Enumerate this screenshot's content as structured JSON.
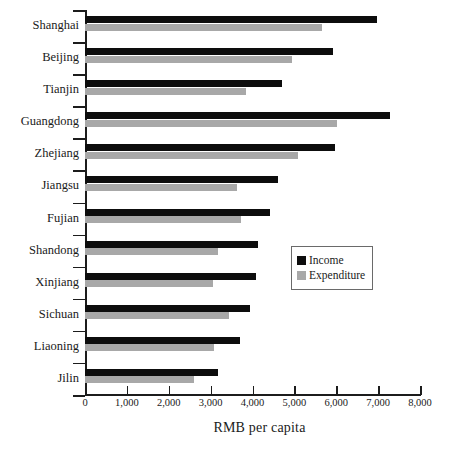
{
  "chart_data": {
    "type": "bar",
    "orientation": "horizontal",
    "title": "",
    "xlabel": "RMB per capita",
    "ylabel": "",
    "xlim": [
      0,
      8000
    ],
    "xticks": [
      "0",
      "1,000",
      "2,000",
      "3,000",
      "4,000",
      "5,000",
      "6,000",
      "7,000",
      "8,000"
    ],
    "xtick_values": [
      0,
      1000,
      2000,
      3000,
      4000,
      5000,
      6000,
      7000,
      8000
    ],
    "grid": false,
    "legend_position": "center-right",
    "categories": [
      "Shanghai",
      "Beijing",
      "Tianjin",
      "Guangdong",
      "Zhejiang",
      "Jiangsu",
      "Fujian",
      "Shandong",
      "Xinjiang",
      "Sichuan",
      "Liaoning",
      "Jilin"
    ],
    "series": [
      {
        "name": "Income",
        "color": "#0d0d0d",
        "values": [
          6980,
          5930,
          4700,
          7280,
          5970,
          4600,
          4420,
          4130,
          4080,
          3950,
          3700,
          3180
        ]
      },
      {
        "name": "Expenditure",
        "color": "#a8a8a8",
        "values": [
          5650,
          4950,
          3840,
          6020,
          5080,
          3620,
          3720,
          3180,
          3050,
          3440,
          3070,
          2600
        ]
      }
    ]
  },
  "legend": {
    "items": [
      {
        "label": "Income",
        "color": "#0d0d0d"
      },
      {
        "label": "Expenditure",
        "color": "#a8a8a8"
      }
    ]
  },
  "axis": {
    "x_title": "RMB per capita"
  },
  "footnote": ""
}
